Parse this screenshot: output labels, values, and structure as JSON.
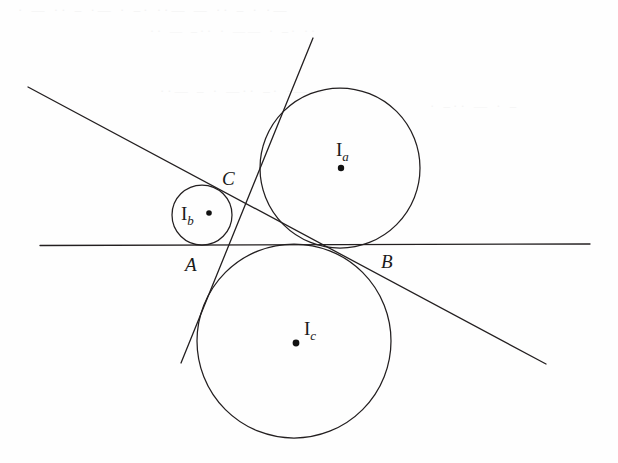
{
  "figure": {
    "kind": "geometry-diagram",
    "background_color": "#fefefe",
    "ink_color": "#231f20",
    "width": 618,
    "height": 463
  },
  "bleed_text": {
    "line1": "· — ·· –  ·— ·  –·  ··—  — ··  – · ·—",
    "line2": "·· —  –··  · —— ·  –· ··",
    "line3": "··— – ·  —·· –·  ·——",
    "line4": "· –··  — · –"
  },
  "circles": [
    {
      "id": "Ia",
      "label": "I",
      "subscript": "a",
      "label_x": 336,
      "label_y": 156,
      "cx": 340,
      "cy": 168,
      "r": 80,
      "center_dot_x": 341,
      "center_dot_y": 168,
      "center_dot_r": 3.2
    },
    {
      "id": "Ib",
      "label": "I",
      "subscript": "b",
      "label_x": 181,
      "label_y": 220,
      "cx": 202,
      "cy": 215,
      "r": 30,
      "center_dot_x": 209,
      "center_dot_y": 213,
      "center_dot_r": 2.8
    },
    {
      "id": "Ic",
      "label": "I",
      "subscript": "c",
      "label_x": 304,
      "label_y": 335,
      "cx": 294,
      "cy": 341,
      "r": 97,
      "center_dot_x": 296,
      "center_dot_y": 343,
      "center_dot_r": 3.4
    }
  ],
  "lines": [
    {
      "id": "horizontal-tangent",
      "x1": 40,
      "y1": 245.5,
      "x2": 590,
      "y2": 244.0
    },
    {
      "id": "descending-tangent",
      "x1": 28,
      "y1": 87,
      "x2": 546,
      "y2": 364
    },
    {
      "id": "steep-tangent",
      "x1": 313,
      "y1": 38,
      "x2": 181,
      "y2": 363
    }
  ],
  "points": [
    {
      "id": "A",
      "label": "A",
      "x": 185,
      "y": 271
    },
    {
      "id": "B",
      "label": "B",
      "x": 381,
      "y": 268
    },
    {
      "id": "C",
      "label": "C",
      "x": 222,
      "y": 185
    }
  ]
}
